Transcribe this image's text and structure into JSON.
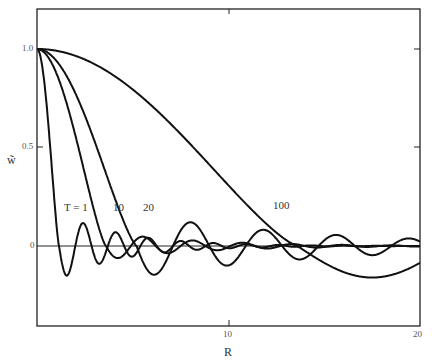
{
  "chart_data": {
    "type": "line",
    "title": "",
    "xlabel": "R",
    "ylabel": "w~",
    "xlim": [
      0,
      20
    ],
    "ylim": [
      -0.33,
      1.15
    ],
    "x_ticks": [
      "10",
      "20"
    ],
    "y_ticks": [
      "1.0",
      "0.5",
      "0"
    ],
    "grid": false,
    "legend": "inline curve labels",
    "series": [
      {
        "name": "T = 1",
        "label": "T = 1",
        "first_zero": 1.1,
        "period": 1.7,
        "min": -0.17,
        "at_min_R": 2.0
      },
      {
        "name": "T = 10",
        "label": "10",
        "first_zero": 3.8,
        "period": 2.6,
        "min": -0.07
      },
      {
        "name": "T = 20",
        "label": "20",
        "first_zero": 5.1,
        "period": 3.6,
        "min": -0.16
      },
      {
        "name": "T = 100",
        "label": "100",
        "first_zero": 13.5,
        "period": 15,
        "min": -0.16,
        "at_min_R": 17.5
      }
    ]
  }
}
